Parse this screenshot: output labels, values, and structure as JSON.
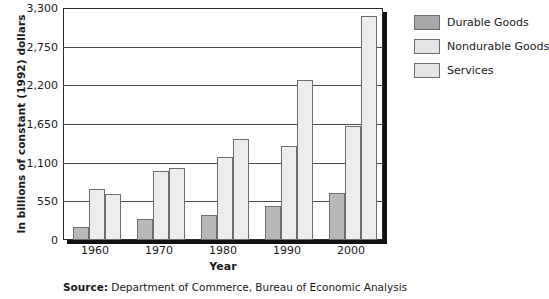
{
  "chart_data": {
    "type": "bar",
    "title": "",
    "xlabel": "Year",
    "ylabel": "In billions of constant (1992) dollars",
    "categories": [
      "1960",
      "1970",
      "1980",
      "1990",
      "2000"
    ],
    "series": [
      {
        "name": "Durable Goods",
        "values": [
          190,
          300,
          350,
          480,
          670
        ]
      },
      {
        "name": "Nondurable Goods",
        "values": [
          730,
          980,
          1180,
          1340,
          1620
        ]
      },
      {
        "name": "Services",
        "values": [
          650,
          1030,
          1430,
          2280,
          3190
        ]
      }
    ],
    "ylim": [
      0,
      3300
    ],
    "yticks": [
      0,
      550,
      1100,
      1650,
      2200,
      2750,
      3300
    ],
    "ytick_labels": [
      "0",
      "550",
      "1,100",
      "1,650",
      "2,200",
      "2,750",
      "3,300"
    ],
    "grid": true,
    "legend_position": "right",
    "colors": {
      "durable": "#b9b9b9",
      "nondurable": "#ededed",
      "services": "#ededed",
      "axis": "#2a2a2a",
      "gridline": "#4a4a4a",
      "text": "#1a1a1a"
    }
  },
  "legend": {
    "items": [
      {
        "label": "Durable Goods",
        "key": "durable"
      },
      {
        "label": "Nondurable Goods",
        "key": "nondurable"
      },
      {
        "label": "Services",
        "key": "services"
      }
    ]
  },
  "source": {
    "label": "Source:",
    "text": " Department of Commerce, Bureau of Economic Analysis"
  }
}
